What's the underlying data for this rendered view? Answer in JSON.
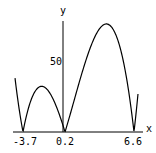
{
  "chart_data": {
    "type": "line",
    "title": "",
    "xlabel": "x",
    "ylabel": "y",
    "function": "|(x+3.7)(x-0.2)(x-6.6)|",
    "x_ticks": [
      "-3.7",
      "0.2",
      "6.6"
    ],
    "y_ticks": [
      "50"
    ],
    "xlim": [
      -4.44,
      6.97
    ],
    "ylim": [
      0,
      80
    ],
    "grid": false,
    "series": [
      {
        "name": "|f(x)|",
        "x": [
          -4.44,
          -3.7,
          -2.0,
          0.2,
          1.0,
          3.6,
          5.0,
          6.6,
          6.97
        ],
        "values": [
          38,
          0,
          32,
          0,
          31,
          77,
          61,
          0,
          27
        ]
      }
    ],
    "roots": [
      -3.7,
      0.2,
      6.6
    ]
  }
}
